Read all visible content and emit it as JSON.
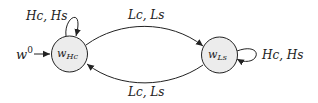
{
  "diagram": {
    "type": "state-machine",
    "initial_label": "w",
    "initial_sup": "0",
    "states": [
      {
        "id": "wHc",
        "base": "w",
        "sub": "Hc",
        "fill": "#ececec"
      },
      {
        "id": "wLs",
        "base": "w",
        "sub": "Ls",
        "fill": "#ececec"
      }
    ],
    "edges": [
      {
        "from": "wHc",
        "to": "wHc",
        "label": "Hc, Hs"
      },
      {
        "from": "wHc",
        "to": "wLs",
        "label": "Lc, Ls"
      },
      {
        "from": "wLs",
        "to": "wHc",
        "label": "Lc, Ls"
      },
      {
        "from": "wLs",
        "to": "wLs",
        "label": "Hc, Hs"
      }
    ]
  }
}
